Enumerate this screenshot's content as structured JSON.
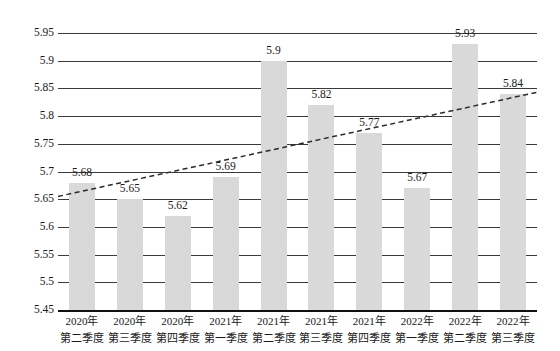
{
  "chart_data": {
    "type": "bar",
    "title": "",
    "subtitle": "",
    "xlabel": "",
    "ylabel": "",
    "ylim": [
      5.45,
      5.95
    ],
    "ytick_step": 0.05,
    "yticks": [
      "5.95",
      "5.9",
      "5.85",
      "5.8",
      "5.75",
      "5.7",
      "5.65",
      "5.6",
      "5.55",
      "5.5",
      "5.45"
    ],
    "grid": true,
    "legend": "none",
    "categories": [
      "2020年第二季度",
      "2020年第三季度",
      "2020年第四季度",
      "2021年第一季度",
      "2021年第二季度",
      "2021年第三季度",
      "2021年第四季度",
      "2022年第一季度",
      "2022年第二季度",
      "2022年第三季度"
    ],
    "category_lines": [
      [
        "2020年",
        "第二季度"
      ],
      [
        "2020年",
        "第三季度"
      ],
      [
        "2020年",
        "第四季度"
      ],
      [
        "2021年",
        "第一季度"
      ],
      [
        "2021年",
        "第二季度"
      ],
      [
        "2021年",
        "第三季度"
      ],
      [
        "2021年",
        "第四季度"
      ],
      [
        "2022年",
        "第一季度"
      ],
      [
        "2022年",
        "第二季度"
      ],
      [
        "2022年",
        "第三季度"
      ]
    ],
    "values": [
      5.68,
      5.65,
      5.62,
      5.69,
      5.9,
      5.82,
      5.77,
      5.67,
      5.93,
      5.84
    ],
    "data_labels": [
      "5.68",
      "5.65",
      "5.62",
      "5.69",
      "5.9",
      "5.82",
      "5.77",
      "5.67",
      "5.93",
      "5.84"
    ],
    "series": [
      {
        "name": "",
        "type": "bar",
        "color": "#d9d9d9",
        "values": [
          5.68,
          5.65,
          5.62,
          5.69,
          5.9,
          5.82,
          5.77,
          5.67,
          5.93,
          5.84
        ]
      },
      {
        "name": "",
        "type": "line",
        "style": "dashed",
        "color": "#2b2b2b",
        "start_value": 5.655,
        "end_value": 5.843
      }
    ],
    "colors": {
      "bar_fill": "#d9d9d9",
      "gridline": "#3a3a3a",
      "axis": "#111111",
      "trendline": "#2b2b2b",
      "text": "#1a1a1a"
    }
  }
}
